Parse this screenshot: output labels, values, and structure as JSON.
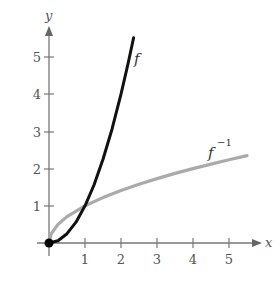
{
  "chart_data": {
    "type": "line",
    "title": "",
    "xlabel": "x",
    "ylabel": "y",
    "xlim": [
      0,
      5.7
    ],
    "ylim": [
      0,
      5.6
    ],
    "x_ticks": [
      "1",
      "2",
      "3",
      "4",
      "5"
    ],
    "y_ticks": [
      "1",
      "2",
      "3",
      "4",
      "5"
    ],
    "grid": false,
    "legend": "none (inline curve labels)",
    "series": [
      {
        "name": "f",
        "label": "f",
        "color": "#111111",
        "x": [
          0,
          0.25,
          0.5,
          0.75,
          1,
          1.25,
          1.5,
          1.75,
          2,
          2.2,
          2.35
        ],
        "y": [
          0,
          0.06,
          0.25,
          0.56,
          1,
          1.56,
          2.25,
          3.06,
          4,
          4.84,
          5.52
        ]
      },
      {
        "name": "f^-1",
        "label": "f",
        "label_superscript": "−1",
        "color": "#aaaaaa",
        "x": [
          0,
          0.06,
          0.25,
          0.5,
          1,
          1.5,
          2,
          2.5,
          3,
          3.5,
          4,
          4.5,
          5,
          5.5
        ],
        "y": [
          0,
          0.25,
          0.5,
          0.71,
          1,
          1.22,
          1.41,
          1.58,
          1.73,
          1.87,
          2,
          2.12,
          2.24,
          2.35
        ]
      }
    ],
    "annotations": [
      {
        "type": "point",
        "x": 0,
        "y": 0,
        "style": "filled black dot"
      },
      {
        "type": "intersection",
        "x": 1,
        "y": 1
      }
    ]
  },
  "labels": {
    "x_axis": "x",
    "y_axis": "y",
    "f": "f",
    "finv_base": "f",
    "finv_sup": "−1",
    "xt1": "1",
    "xt2": "2",
    "xt3": "3",
    "xt4": "4",
    "xt5": "5",
    "yt1": "1",
    "yt2": "2",
    "yt3": "3",
    "yt4": "4",
    "yt5": "5"
  }
}
